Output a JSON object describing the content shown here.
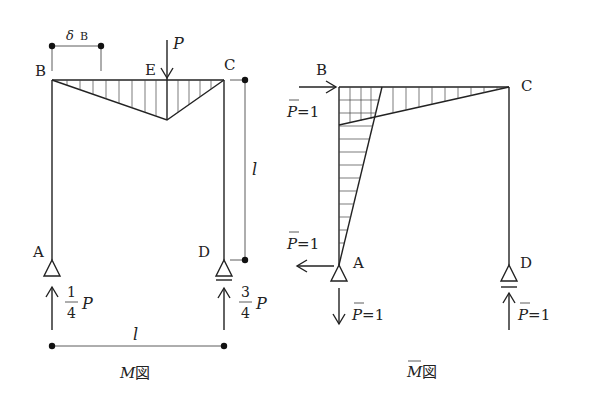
{
  "left_diagram": {
    "caption": "M図",
    "caption_main": "M",
    "caption_suffix": "図",
    "nodes": {
      "A": "A",
      "B": "B",
      "C": "C",
      "D": "D",
      "E": "E"
    },
    "load_label": "P",
    "deflection_label": "δ",
    "deflection_subscript": "B",
    "span_label": "l",
    "height_label": "l",
    "reaction_A": {
      "numerator": "1",
      "denominator": "4",
      "symbol": "P"
    },
    "reaction_D": {
      "numerator": "3",
      "denominator": "4",
      "symbol": "P"
    }
  },
  "right_diagram": {
    "caption": "M̄図",
    "caption_main": "M",
    "caption_suffix": "図",
    "nodes": {
      "A": "A",
      "B": "B",
      "C": "C",
      "D": "D"
    },
    "unit_load_B": {
      "symbol": "P",
      "value": "=1"
    },
    "reaction_A_horizontal": {
      "symbol": "P",
      "value": "=1"
    },
    "reaction_A_vertical": {
      "symbol": "P",
      "value": "=1"
    },
    "reaction_D_vertical": {
      "symbol": "P",
      "value": "=1"
    }
  },
  "colors": {
    "line": "#222222",
    "background": "#ffffff"
  }
}
